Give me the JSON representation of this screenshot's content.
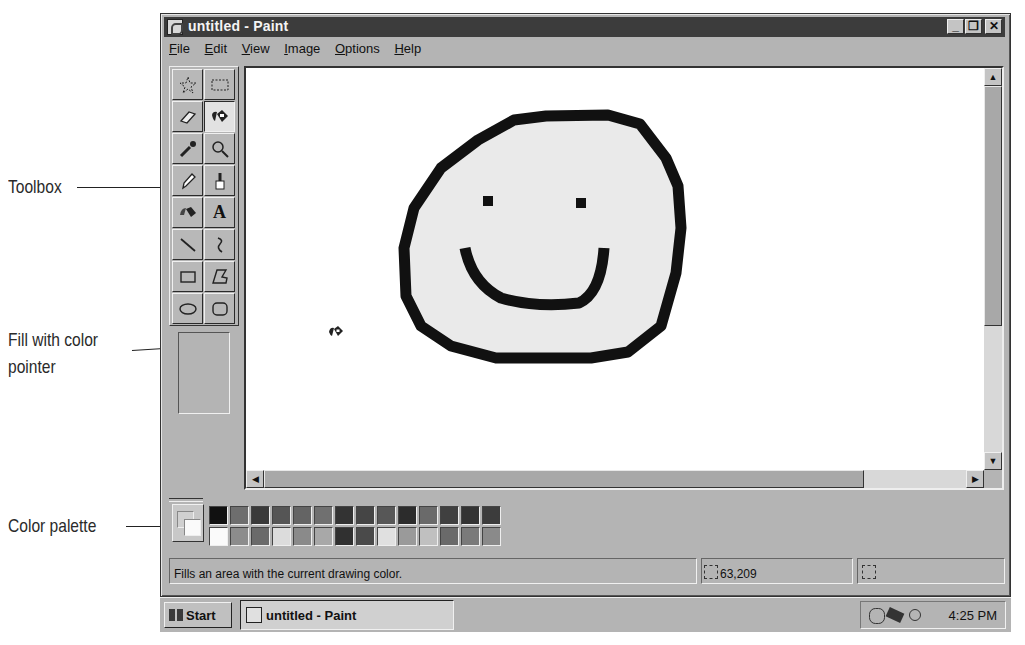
{
  "window": {
    "title": "untitled - Paint",
    "controls": {
      "minimize": "_",
      "restore": "❐",
      "close": "✕"
    }
  },
  "menu": [
    {
      "label": "File",
      "accel": "F",
      "rest": "ile"
    },
    {
      "label": "Edit",
      "accel": "E",
      "rest": "dit"
    },
    {
      "label": "View",
      "accel": "V",
      "rest": "iew"
    },
    {
      "label": "Image",
      "accel": "I",
      "rest": "mage"
    },
    {
      "label": "Options",
      "accel": "O",
      "rest": "ptions"
    },
    {
      "label": "Help",
      "accel": "H",
      "rest": "elp"
    }
  ],
  "toolbox": {
    "tools": [
      {
        "name": "free-form-select",
        "icon": "star-select-icon"
      },
      {
        "name": "select",
        "icon": "rect-select-icon"
      },
      {
        "name": "eraser",
        "icon": "eraser-icon"
      },
      {
        "name": "fill-with-color",
        "icon": "paint-bucket-icon",
        "active": true
      },
      {
        "name": "pick-color",
        "icon": "eyedropper-icon"
      },
      {
        "name": "magnifier",
        "icon": "magnifier-icon"
      },
      {
        "name": "pencil",
        "icon": "pencil-icon"
      },
      {
        "name": "brush",
        "icon": "brush-icon"
      },
      {
        "name": "airbrush",
        "icon": "airbrush-icon"
      },
      {
        "name": "text",
        "icon": "text-icon",
        "glyph": "A"
      },
      {
        "name": "line",
        "icon": "line-icon"
      },
      {
        "name": "curve",
        "icon": "curve-icon"
      },
      {
        "name": "rectangle",
        "icon": "rectangle-icon"
      },
      {
        "name": "polygon",
        "icon": "polygon-icon"
      },
      {
        "name": "ellipse",
        "icon": "ellipse-icon"
      },
      {
        "name": "rounded-rectangle",
        "icon": "rounded-rect-icon"
      }
    ]
  },
  "palette": {
    "foreground": "#d0d0d0",
    "background": "#fafafa",
    "top_row": [
      "#111111",
      "#6e6e6e",
      "#3a3a3a",
      "#555555",
      "#646464",
      "#707070",
      "#333333",
      "#454545",
      "#575757",
      "#2c2c2c",
      "#6a6a6a",
      "#404040",
      "#333333",
      "#3c3c3c"
    ],
    "bottom_row": [
      "#fafafa",
      "#8c8c8c",
      "#6a6a6a",
      "#dcdcdc",
      "#8a8a8a",
      "#a8a8a8",
      "#303030",
      "#4a4a4a",
      "#e0e0e0",
      "#9a9a9a",
      "#c0c0c0",
      "#6a6a6a",
      "#7a7a7a",
      "#8a8a8a"
    ]
  },
  "status": {
    "message": "Fills an area with the current drawing color.",
    "coordinates": "63,209",
    "selection_size": ""
  },
  "taskbar": {
    "start_label": "Start",
    "task_label": "untitled - Paint",
    "clock": "4:25 PM"
  },
  "callouts": {
    "toolbox": "Toolbox",
    "fill_pointer_line1": "Fill with color",
    "fill_pointer_line2": "pointer",
    "color_palette": "Color palette"
  }
}
